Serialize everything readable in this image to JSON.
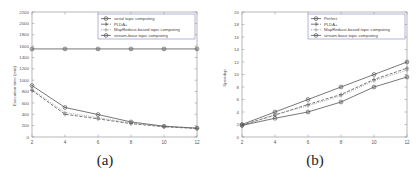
{
  "figure": {
    "panels": [
      {
        "id": "a",
        "caption": "(a)",
        "chart_data": {
          "type": "line",
          "title": "",
          "xlabel": "",
          "ylabel": "Execution time (min)",
          "x": [
            2,
            4,
            6,
            8,
            10,
            12
          ],
          "xlim": [
            2,
            12
          ],
          "ylim": [
            0,
            2200
          ],
          "xticks": [
            2,
            4,
            6,
            8,
            10,
            12
          ],
          "yticks": [
            0,
            200,
            400,
            600,
            800,
            1000,
            1200,
            1400,
            1600,
            1800,
            2000,
            2200
          ],
          "grid": false,
          "legend_position": "top-right",
          "series": [
            {
              "name": "serial topic computing",
              "values": [
                1550,
                1550,
                1550,
                1550,
                1550,
                1550
              ],
              "color": "#555555",
              "dash": "none",
              "marker": "circle-dot"
            },
            {
              "name": "PLDA+",
              "values": [
                820,
                400,
                320,
                235,
                180,
                150
              ],
              "color": "#555555",
              "dash": "dashed",
              "marker": "plus"
            },
            {
              "name": "MapReduce-based topic computing",
              "values": [
                840,
                430,
                340,
                245,
                185,
                155
              ],
              "color": "#999999",
              "dash": "dotted",
              "marker": "plus"
            },
            {
              "name": "stream-base topic computing",
              "values": [
                905,
                520,
                395,
                265,
                190,
                155
              ],
              "color": "#555555",
              "dash": "none",
              "marker": "circle-dot"
            }
          ]
        }
      },
      {
        "id": "b",
        "caption": "(b)",
        "chart_data": {
          "type": "line",
          "title": "",
          "xlabel": "",
          "ylabel": "Speedup",
          "x": [
            2,
            4,
            6,
            8,
            10,
            12
          ],
          "xlim": [
            2,
            12
          ],
          "ylim": [
            0,
            20
          ],
          "xticks": [
            2,
            4,
            6,
            8,
            10,
            12
          ],
          "yticks": [
            0,
            2,
            4,
            6,
            8,
            10,
            12,
            14,
            16,
            18,
            20
          ],
          "grid": false,
          "legend_position": "top-right",
          "series": [
            {
              "name": "Perfect",
              "values": [
                2,
                4,
                6,
                8,
                10,
                12
              ],
              "color": "#555555",
              "dash": "none",
              "marker": "circle-dot"
            },
            {
              "name": "PLDA+",
              "values": [
                1.9,
                3.5,
                5.2,
                6.8,
                9.2,
                11.0
              ],
              "color": "#555555",
              "dash": "dashed",
              "marker": "plus"
            },
            {
              "name": "MapReduce-based topic computing",
              "values": [
                1.8,
                3.6,
                5.0,
                6.6,
                9.0,
                10.7
              ],
              "color": "#999999",
              "dash": "dotted",
              "marker": "plus"
            },
            {
              "name": "stream-base topic computing",
              "values": [
                1.85,
                3.0,
                4.0,
                5.6,
                8.0,
                9.6
              ],
              "color": "#555555",
              "dash": "none",
              "marker": "circle-dot"
            }
          ]
        }
      }
    ]
  }
}
